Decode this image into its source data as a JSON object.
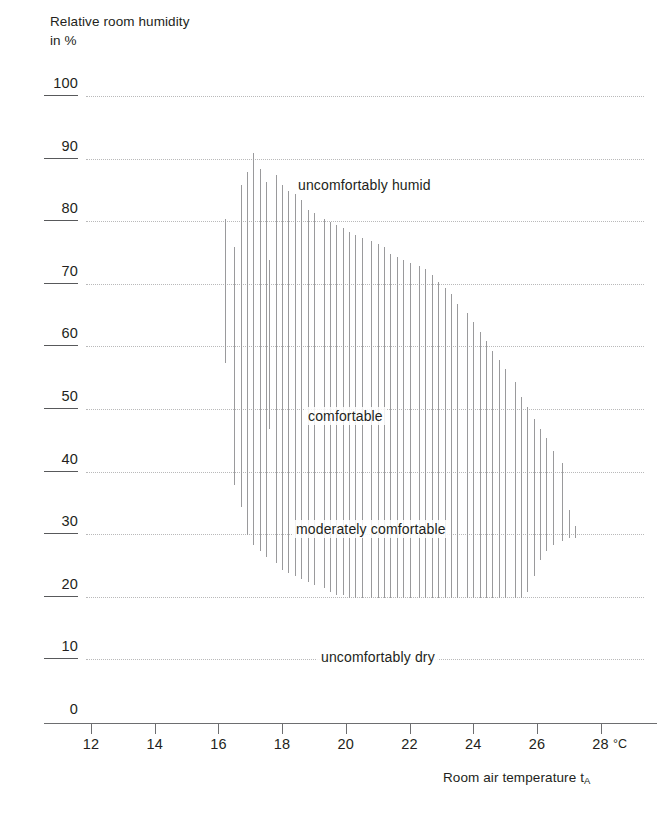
{
  "axes": {
    "y_title_line1": "Relative room humidity",
    "y_title_line2": "in %",
    "x_title": "Room air temperature t",
    "x_title_sub": "A",
    "x_unit": "°C"
  },
  "chart_data": {
    "type": "area",
    "title": "",
    "xlabel": "Room air temperature tA",
    "ylabel": "Relative room humidity in %",
    "xlim": [
      11,
      28.8
    ],
    "ylim": [
      0,
      100
    ],
    "grid": true,
    "legend_position": "none",
    "x_ticks": [
      12,
      14,
      16,
      18,
      20,
      22,
      24,
      26,
      28
    ],
    "y_ticks": [
      0,
      10,
      20,
      30,
      40,
      50,
      60,
      70,
      80,
      90,
      100
    ],
    "annotations": [
      {
        "text": "uncomfortably humid",
        "x": 20.6,
        "y": 86
      },
      {
        "text": "comfortable",
        "x": 20.0,
        "y": 49
      },
      {
        "text": "moderately comfortable",
        "x": 20.8,
        "y": 31
      },
      {
        "text": "uncomfortably dry",
        "x": 21.0,
        "y": 10.5
      }
    ],
    "series": [
      {
        "name": "comfort band upper bound",
        "x": [
          16.2,
          16.5,
          16.7,
          16.9,
          17.1,
          17.3,
          17.5,
          17.8,
          18.0,
          18.2,
          18.4,
          18.6,
          18.8,
          19.0,
          19.3,
          19.5,
          19.7,
          19.9,
          20.1,
          20.3,
          20.5,
          20.8,
          21.0,
          21.2,
          21.4,
          21.6,
          21.8,
          22.0,
          22.3,
          22.5,
          22.7,
          22.9,
          23.1,
          23.3,
          23.5,
          23.8,
          24.0,
          24.2,
          24.4,
          24.6,
          24.8,
          25.0,
          25.3,
          25.5,
          25.7,
          25.9,
          26.1,
          26.3,
          26.5,
          26.8,
          27.0,
          27.2
        ],
        "values": [
          80.5,
          76.0,
          86.0,
          88.0,
          91.0,
          88.5,
          86.5,
          87.5,
          86.0,
          85.0,
          84.5,
          83.5,
          82.0,
          81.5,
          80.5,
          80.0,
          79.5,
          79.0,
          78.5,
          78.0,
          77.5,
          77.0,
          76.5,
          76.0,
          75.0,
          74.5,
          74.0,
          73.5,
          73.0,
          72.5,
          71.5,
          70.5,
          69.5,
          68.5,
          67.0,
          65.5,
          64.0,
          62.5,
          61.0,
          59.5,
          58.0,
          56.5,
          54.5,
          52.0,
          50.5,
          48.5,
          47.0,
          45.5,
          43.5,
          41.5,
          34.0,
          31.5
        ]
      },
      {
        "name": "comfort band lower bound",
        "x": [
          16.2,
          16.5,
          16.7,
          16.9,
          17.1,
          17.3,
          17.5,
          17.8,
          18.0,
          18.2,
          18.4,
          18.6,
          18.8,
          19.0,
          19.3,
          19.5,
          19.7,
          19.9,
          20.1,
          20.3,
          20.5,
          20.8,
          21.0,
          21.2,
          21.4,
          21.6,
          21.8,
          22.0,
          22.3,
          22.5,
          22.7,
          22.9,
          23.1,
          23.3,
          23.5,
          23.8,
          24.0,
          24.2,
          24.4,
          24.6,
          24.8,
          25.0,
          25.3,
          25.5,
          25.7,
          25.9,
          26.1,
          26.3,
          26.5,
          26.8,
          27.0,
          27.2
        ],
        "values": [
          57.5,
          38.0,
          34.5,
          30.0,
          28.5,
          27.5,
          26.5,
          25.5,
          24.5,
          24.0,
          23.5,
          23.0,
          22.5,
          22.0,
          21.5,
          21.0,
          20.5,
          20.5,
          20.0,
          20.0,
          20.0,
          20.0,
          20.0,
          20.0,
          20.0,
          20.0,
          20.0,
          20.0,
          20.0,
          20.0,
          20.0,
          20.0,
          20.0,
          20.0,
          20.0,
          20.0,
          20.0,
          20.0,
          20.0,
          20.0,
          20.0,
          20.0,
          20.0,
          20.0,
          21.0,
          23.5,
          26.0,
          27.5,
          28.5,
          29.0,
          29.5,
          29.5
        ]
      },
      {
        "name": "inner comfortable band upper bound",
        "x": [
          17.6,
          17.8,
          18.0,
          18.2,
          18.4,
          18.6,
          18.8,
          19.0,
          19.3,
          19.5,
          19.7,
          19.9,
          20.1,
          20.3,
          20.5,
          20.8,
          21.0,
          21.2,
          21.4,
          21.6,
          21.8,
          22.0,
          22.3,
          22.5,
          22.7,
          22.9,
          23.1,
          23.3,
          23.5,
          23.8,
          24.0,
          24.2,
          24.4,
          24.6,
          24.8,
          25.0,
          25.3,
          25.5
        ],
        "values": [
          74.0,
          73.5,
          73.5,
          72.5,
          72.0,
          71.0,
          70.0,
          69.5,
          68.5,
          68.0,
          67.5,
          67.0,
          66.5,
          66.0,
          65.5,
          65.0,
          64.0,
          63.5,
          62.5,
          61.5,
          60.5,
          59.5,
          58.0,
          56.5,
          55.0,
          53.5,
          52.0,
          50.5,
          49.0,
          47.5,
          46.0,
          45.0,
          43.5,
          42.0,
          41.0,
          40.0,
          38.0,
          36.5
        ]
      },
      {
        "name": "inner comfortable band lower bound",
        "x": [
          17.6,
          17.8,
          18.0,
          18.2,
          18.4,
          18.6,
          18.8,
          19.0,
          19.3,
          19.5,
          19.7,
          19.9,
          20.1,
          20.3,
          20.5,
          20.8,
          21.0,
          21.2,
          21.4,
          21.6,
          21.8,
          22.0,
          22.3,
          22.5,
          22.7,
          22.9,
          23.1,
          23.3,
          23.5,
          23.8,
          24.0,
          24.2,
          24.4,
          24.6,
          24.8,
          25.0,
          25.3,
          25.5
        ],
        "values": [
          47.0,
          44.0,
          41.5,
          40.0,
          39.0,
          38.0,
          37.5,
          37.0,
          36.5,
          36.0,
          35.5,
          35.5,
          35.0,
          35.0,
          34.5,
          34.5,
          34.0,
          34.0,
          34.0,
          33.5,
          33.5,
          33.5,
          33.0,
          33.0,
          33.0,
          33.0,
          33.0,
          33.0,
          33.0,
          33.0,
          33.0,
          33.0,
          33.0,
          33.0,
          33.0,
          33.5,
          34.0,
          34.5
        ]
      }
    ],
    "colors": {
      "line": "#9a9a9c",
      "grid": "#b9b9ba",
      "axis": "#6d6e70",
      "text": "#231f20"
    }
  }
}
